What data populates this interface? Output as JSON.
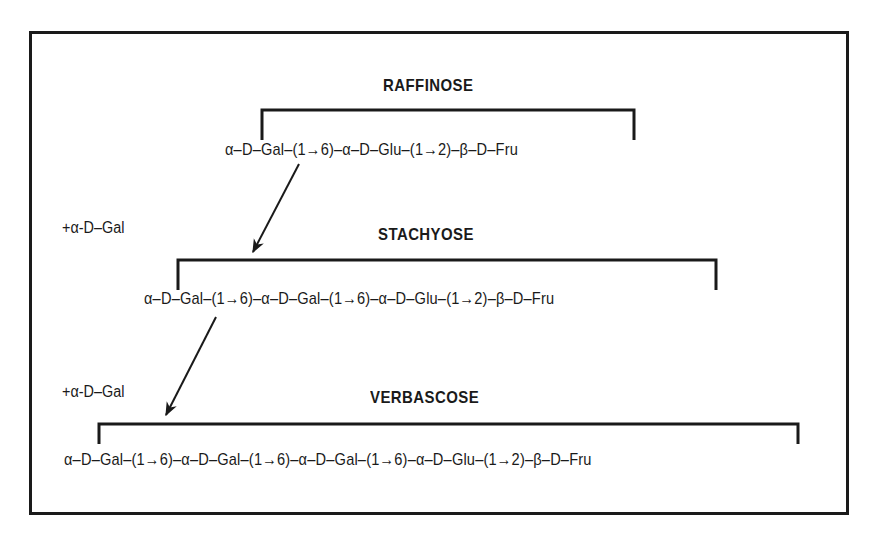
{
  "diagram": {
    "raffinose": {
      "title": "RAFFINOSE",
      "chain": "α–D–Gal–(1→6)–α–D–Glu–(1→2)–β–D–Fru"
    },
    "stachyose": {
      "title": "STACHYOSE",
      "chain": "α–D–Gal–(1→6)–α–D–Gal–(1→6)–α–D–Glu–(1→2)–β–D–Fru",
      "added_unit": "+α-D–Gal"
    },
    "verbascose": {
      "title": "VERBASCOSE",
      "chain": "α–D–Gal–(1→6)–α–D–Gal–(1→6)–α–D–Gal–(1→6)–α–D–Glu–(1→2)–β–D–Fru",
      "added_unit": "+α-D–Gal"
    },
    "colors": {
      "ink": "#1a1a1a",
      "background": "#ffffff"
    }
  }
}
